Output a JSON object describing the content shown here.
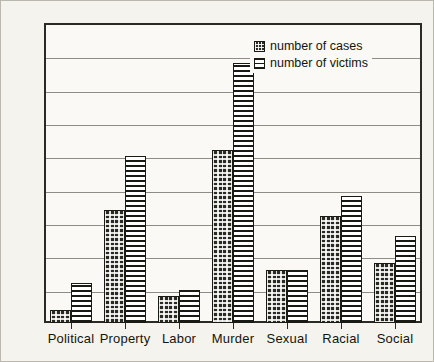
{
  "chart_data": {
    "type": "bar",
    "title": "",
    "xlabel": "",
    "ylabel": "",
    "ylim": [
      0,
      45
    ],
    "ytick_step": 5,
    "yticks": [
      0,
      5,
      10,
      15,
      20,
      25,
      30,
      35,
      40,
      45
    ],
    "grid": true,
    "legend_position": "top-right",
    "categories": [
      "Political",
      "Property",
      "Labor",
      "Murder",
      "Sexual",
      "Racial",
      "Social"
    ],
    "series": [
      {
        "name": "number of cases",
        "pattern": "checkered-dark",
        "color": "#2a2a22",
        "values": [
          2,
          17,
          4,
          26,
          8,
          16,
          9
        ]
      },
      {
        "name": "number of victims",
        "pattern": "horizontal-lines",
        "color": "#ffffff",
        "values": [
          6,
          25,
          5,
          39,
          8,
          19,
          13
        ]
      }
    ]
  },
  "legend": {
    "items": [
      {
        "label": "number of cases",
        "swatch": "checkered-dark-swatch"
      },
      {
        "label": "number of victims",
        "swatch": "horizontal-lines-swatch"
      }
    ]
  },
  "colors": {
    "background": "#f4f3ee",
    "axis": "#2b2b26",
    "gridline": "#8d8d86",
    "bar_cases": "#2a2a22",
    "bar_victims": "#ffffff",
    "text": "#15150f"
  }
}
